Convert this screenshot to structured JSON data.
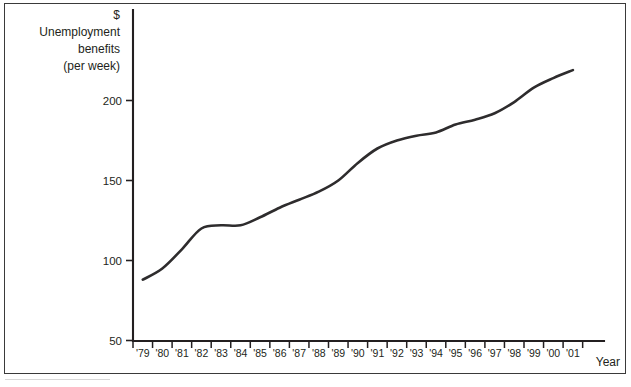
{
  "chart_data": {
    "type": "line",
    "title": "",
    "subtitle": "",
    "ylabel_lines": [
      "$",
      "Unemployment",
      "benefits",
      "(per week)"
    ],
    "xlabel": "Year",
    "categories": [
      "'79",
      "'80",
      "'81",
      "'82",
      "'83",
      "'84",
      "'85",
      "'86",
      "'87",
      "'88",
      "'89",
      "'90",
      "'91",
      "'92",
      "'93",
      "'94",
      "'95",
      "'96",
      "'97",
      "'98",
      "'99",
      "'00",
      "'01"
    ],
    "values": [
      88,
      95,
      107,
      120,
      122,
      122,
      127,
      133,
      138,
      143,
      150,
      161,
      170,
      175,
      178,
      180,
      185,
      188,
      192,
      199,
      208,
      214,
      219
    ],
    "series": [
      {
        "name": "Unemployment benefits (per week)",
        "values": [
          88,
          95,
          107,
          120,
          122,
          122,
          127,
          133,
          138,
          143,
          150,
          161,
          170,
          175,
          178,
          180,
          185,
          188,
          192,
          199,
          208,
          214,
          219
        ]
      }
    ],
    "yticks": [
      50,
      100,
      150,
      200
    ],
    "ytick_labels": [
      "50",
      "100",
      "150",
      "200"
    ],
    "ylim": [
      50,
      231
    ],
    "xlim": [
      "'79",
      "'01"
    ],
    "grid": false,
    "legend": "none",
    "line_color": "#2e2c2d",
    "axis_color": "#231f20",
    "background_color": "#ffffff"
  },
  "axes": {
    "y_title": {
      "line1": "$",
      "line2": "Unemployment",
      "line3": "benefits",
      "line4": "(per week)"
    },
    "x_title": "Year"
  }
}
